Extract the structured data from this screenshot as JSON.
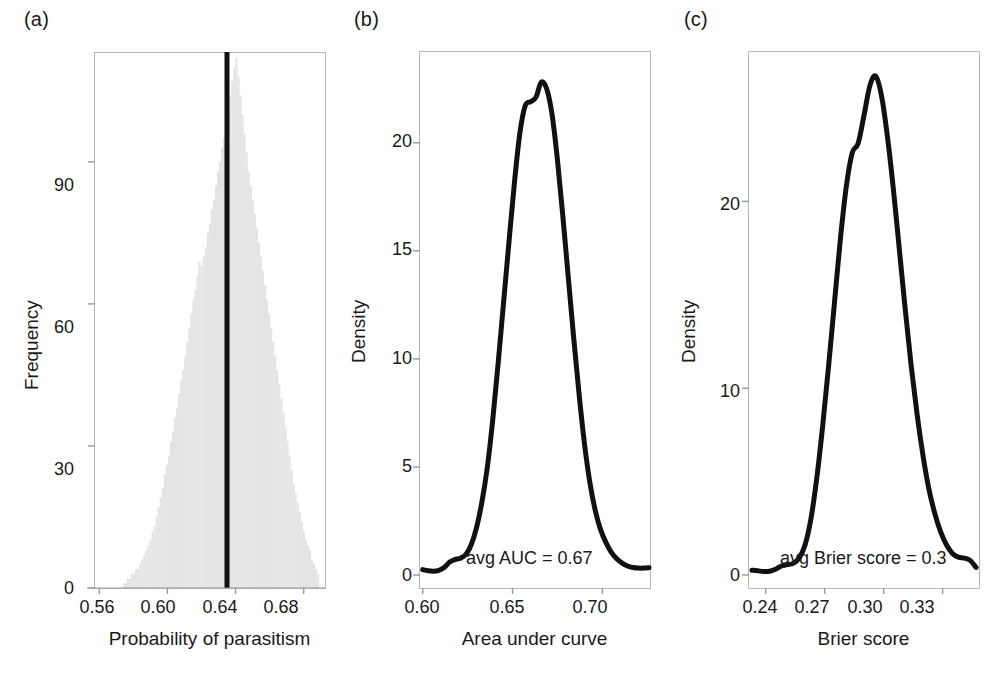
{
  "figure": {
    "background": "#ffffff",
    "line_color": "#111111",
    "hist_fill": "#e3e3e3",
    "frame_color": "#b9b9b9",
    "width": 997,
    "height": 684
  },
  "panels": [
    {
      "label": "(a)",
      "xlabel": "Probability of parasitism",
      "ylabel": "Frequency",
      "xticks": [
        "0.56",
        "0.60",
        "0.64",
        "0.68"
      ],
      "yticks": [
        "0",
        "30",
        "60",
        "90"
      ],
      "annotation": ""
    },
    {
      "label": "(b)",
      "xlabel": "Area under curve",
      "ylabel": "Density",
      "xticks": [
        "0.60",
        "0.65",
        "0.70"
      ],
      "yticks": [
        "0",
        "5",
        "10",
        "15",
        "20"
      ],
      "annotation": "avg AUC = 0.67"
    },
    {
      "label": "(c)",
      "xlabel": "Brier score",
      "ylabel": "Density",
      "xticks": [
        "0.24",
        "0.27",
        "0.30",
        "0.33"
      ],
      "yticks": [
        "0",
        "10",
        "20"
      ],
      "annotation": "avg Brier score = 0.3"
    }
  ],
  "chart_data": [
    {
      "type": "bar",
      "panel": "(a)",
      "title": "",
      "xlabel": "Probability of parasitism",
      "ylabel": "Frequency",
      "xlim": [
        0.5575,
        0.6925
      ],
      "ylim": [
        0,
        113
      ],
      "xticks": [
        0.56,
        0.6,
        0.64,
        0.68
      ],
      "yticks": [
        0,
        30,
        60,
        90
      ],
      "grid": false,
      "legend": null,
      "reference_line": {
        "orientation": "vertical",
        "x": 0.645,
        "color": "#111111",
        "width_px": 5
      },
      "bin_width": 0.0012,
      "x": [
        0.5745,
        0.5757,
        0.5769,
        0.5781,
        0.5793,
        0.5805,
        0.5817,
        0.5829,
        0.5841,
        0.5853,
        0.5865,
        0.5877,
        0.5889,
        0.5901,
        0.5913,
        0.5925,
        0.5937,
        0.5949,
        0.5961,
        0.5973,
        0.5985,
        0.5997,
        0.6009,
        0.6021,
        0.6033,
        0.6045,
        0.6057,
        0.6069,
        0.6081,
        0.6093,
        0.6105,
        0.6117,
        0.6129,
        0.6141,
        0.6153,
        0.6165,
        0.6177,
        0.6189,
        0.6201,
        0.6213,
        0.6225,
        0.6237,
        0.6249,
        0.6261,
        0.6273,
        0.6285,
        0.6297,
        0.6309,
        0.6321,
        0.6333,
        0.6345,
        0.6357,
        0.6369,
        0.6381,
        0.6393,
        0.6405,
        0.6417,
        0.6429,
        0.6441,
        0.6453,
        0.6465,
        0.6477,
        0.6489,
        0.6501,
        0.6513,
        0.6525,
        0.6537,
        0.6549,
        0.6561,
        0.6573,
        0.6585,
        0.6597,
        0.6609,
        0.6621,
        0.6633,
        0.6645,
        0.6657,
        0.6669,
        0.6681,
        0.6693,
        0.6705,
        0.6717,
        0.6729,
        0.6741,
        0.6753,
        0.6765,
        0.6777,
        0.6789,
        0.6801,
        0.6813,
        0.6825,
        0.6837,
        0.6849,
        0.6861,
        0.6873,
        0.6885
      ],
      "values": [
        1,
        1,
        2,
        2,
        3,
        3,
        4,
        4,
        5,
        6,
        7,
        8,
        9,
        10,
        12,
        13,
        15,
        17,
        19,
        21,
        24,
        26,
        28,
        31,
        33,
        36,
        38,
        41,
        44,
        46,
        49,
        52,
        55,
        58,
        61,
        63,
        66,
        69,
        68,
        70,
        72,
        75,
        77,
        80,
        82,
        85,
        88,
        90,
        93,
        95,
        98,
        101,
        104,
        107,
        110,
        112,
        108,
        104,
        100,
        96,
        92,
        88,
        85,
        82,
        79,
        76,
        73,
        70,
        67,
        64,
        61,
        58,
        55,
        52,
        49,
        46,
        43,
        40,
        37,
        34,
        31,
        28,
        25,
        22,
        20,
        18,
        16,
        14,
        12,
        10,
        9,
        8,
        6,
        5,
        4,
        3
      ]
    },
    {
      "type": "line",
      "panel": "(b)",
      "title": "",
      "xlabel": "Area under curve",
      "ylabel": "Density",
      "xlim": [
        0.5985,
        0.7265
      ],
      "ylim": [
        -0.6,
        24.2
      ],
      "xticks": [
        0.6,
        0.65,
        0.7
      ],
      "yticks": [
        0,
        5,
        10,
        15,
        20
      ],
      "grid": false,
      "legend": null,
      "annotation": "avg AUC = 0.67",
      "series": [
        {
          "name": "AUC density",
          "x": [
            0.6,
            0.603,
            0.606,
            0.609,
            0.612,
            0.615,
            0.618,
            0.621,
            0.624,
            0.627,
            0.63,
            0.633,
            0.636,
            0.639,
            0.642,
            0.645,
            0.648,
            0.651,
            0.654,
            0.657,
            0.66,
            0.663,
            0.666,
            0.669,
            0.672,
            0.675,
            0.678,
            0.681,
            0.684,
            0.687,
            0.69,
            0.693,
            0.696,
            0.699,
            0.702,
            0.705,
            0.708,
            0.711,
            0.714,
            0.717,
            0.72,
            0.723,
            0.726
          ],
          "values": [
            0.25,
            0.2,
            0.18,
            0.22,
            0.35,
            0.6,
            0.72,
            0.78,
            0.95,
            1.4,
            2.2,
            3.4,
            5.0,
            7.2,
            9.8,
            12.6,
            15.4,
            18.1,
            20.4,
            21.7,
            21.9,
            22.1,
            22.8,
            22.5,
            21.3,
            19.2,
            16.6,
            13.8,
            11.0,
            8.4,
            6.1,
            4.3,
            3.0,
            2.1,
            1.5,
            1.05,
            0.75,
            0.55,
            0.42,
            0.35,
            0.32,
            0.32,
            0.34
          ]
        }
      ]
    },
    {
      "type": "line",
      "panel": "(c)",
      "title": "",
      "xlabel": "Brier score",
      "ylabel": "Density",
      "xlim": [
        0.2315,
        0.3485
      ],
      "ylim": [
        -0.7,
        28.0
      ],
      "xticks": [
        0.24,
        0.27,
        0.3,
        0.33
      ],
      "yticks": [
        0,
        10,
        20
      ],
      "grid": false,
      "legend": null,
      "annotation": "avg Brier score = 0.3",
      "series": [
        {
          "name": "Brier score density",
          "x": [
            0.233,
            0.236,
            0.239,
            0.242,
            0.245,
            0.248,
            0.251,
            0.254,
            0.257,
            0.26,
            0.263,
            0.266,
            0.269,
            0.272,
            0.275,
            0.278,
            0.281,
            0.284,
            0.287,
            0.29,
            0.293,
            0.296,
            0.299,
            0.302,
            0.305,
            0.308,
            0.311,
            0.314,
            0.317,
            0.32,
            0.323,
            0.326,
            0.329,
            0.332,
            0.335,
            0.338,
            0.341,
            0.344,
            0.347
          ],
          "values": [
            0.25,
            0.22,
            0.18,
            0.2,
            0.3,
            0.48,
            0.55,
            0.62,
            0.9,
            1.6,
            3.0,
            5.2,
            8.0,
            11.2,
            14.6,
            18.0,
            20.8,
            22.6,
            23.1,
            24.6,
            26.2,
            26.7,
            25.6,
            23.4,
            20.6,
            17.4,
            14.2,
            11.2,
            8.6,
            6.4,
            4.6,
            3.3,
            2.3,
            1.6,
            1.15,
            0.95,
            0.9,
            0.78,
            0.4
          ]
        }
      ]
    }
  ]
}
